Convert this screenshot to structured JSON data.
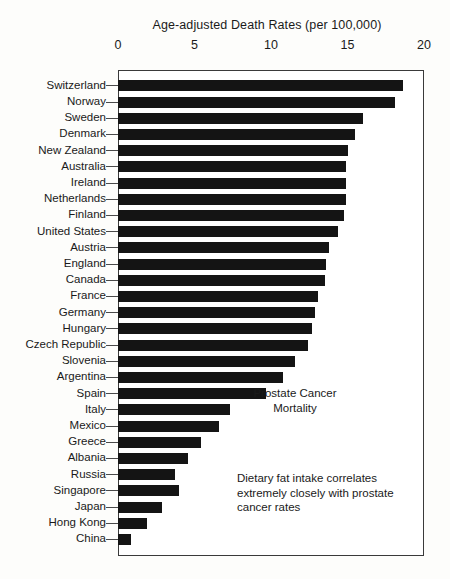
{
  "chart_data": {
    "type": "bar",
    "orientation": "horizontal",
    "title": "Age-adjusted Death Rates (per 100,000)",
    "xlabel": "Age-adjusted Death Rates (per 100,000)",
    "ylabel": "",
    "xlim": [
      0,
      20
    ],
    "xticks": [
      0,
      5,
      10,
      15,
      20
    ],
    "xtick_labels": [
      "0",
      "5",
      "10",
      "15",
      "20"
    ],
    "grid": false,
    "legend": "none",
    "bar_color": "#141414",
    "categories": [
      "Switzerland",
      "Norway",
      "Sweden",
      "Denmark",
      "New Zealand",
      "Australia",
      "Ireland",
      "Netherlands",
      "Finland",
      "United States",
      "Austria",
      "England",
      "Canada",
      "France",
      "Germany",
      "Hungary",
      "Czech Republic",
      "Slovenia",
      "Argentina",
      "Spain",
      "Italy",
      "Mexico",
      "Greece",
      "Albania",
      "Russia",
      "Singapore",
      "Japan",
      "Hong Kong",
      "China"
    ],
    "values": [
      18.6,
      18.1,
      16.0,
      15.5,
      15.0,
      14.9,
      14.9,
      14.9,
      14.8,
      14.4,
      13.8,
      13.6,
      13.5,
      13.1,
      12.9,
      12.7,
      12.4,
      11.6,
      10.8,
      9.7,
      7.3,
      6.6,
      5.4,
      4.6,
      3.7,
      4.0,
      2.9,
      1.9,
      0.85
    ],
    "annotations": [
      {
        "name": "chart-subject",
        "text": "Prostate Cancer\nMortality"
      },
      {
        "name": "chart-conclusion",
        "text": "Dietary fat intake correlates\nextremely closely with prostate\ncancer rates"
      }
    ]
  }
}
